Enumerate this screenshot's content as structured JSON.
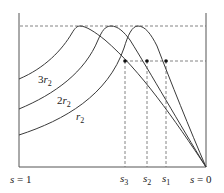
{
  "diagram": {
    "axis_labels": {
      "left": {
        "var": "s",
        "eq": " = 1"
      },
      "right": {
        "var": "s",
        "eq": " = 0"
      }
    },
    "curves": [
      {
        "name": "r2",
        "coef": "",
        "sub": "2"
      },
      {
        "name": "2r2",
        "coef": "2",
        "sub": "2"
      },
      {
        "name": "3r2",
        "coef": "3",
        "sub": "2"
      }
    ],
    "markers": [
      {
        "name": "s3",
        "var": "s",
        "sub": "3"
      },
      {
        "name": "s2",
        "var": "s",
        "sub": "2"
      },
      {
        "name": "s1",
        "var": "s",
        "sub": "1"
      }
    ],
    "colors": {
      "stroke": "#3a3a3a",
      "dashed": "#555555",
      "point": "#111111"
    }
  }
}
